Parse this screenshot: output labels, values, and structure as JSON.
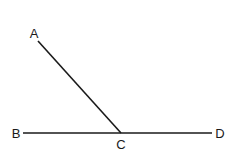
{
  "diagram": {
    "type": "geometry-angle",
    "points": {
      "A": {
        "label": "A",
        "x": 38,
        "y": 41,
        "label_x": 34,
        "label_y": 38
      },
      "B": {
        "label": "B",
        "x": 23,
        "y": 133,
        "label_x": 16,
        "label_y": 138
      },
      "C": {
        "label": "C",
        "x": 121,
        "y": 133,
        "label_x": 121,
        "label_y": 149
      },
      "D": {
        "label": "D",
        "x": 212,
        "y": 133,
        "label_x": 220,
        "label_y": 138
      }
    },
    "segments": [
      {
        "from": "A",
        "to": "C"
      },
      {
        "from": "B",
        "to": "D"
      }
    ],
    "line_color": "#1a1a1a"
  }
}
